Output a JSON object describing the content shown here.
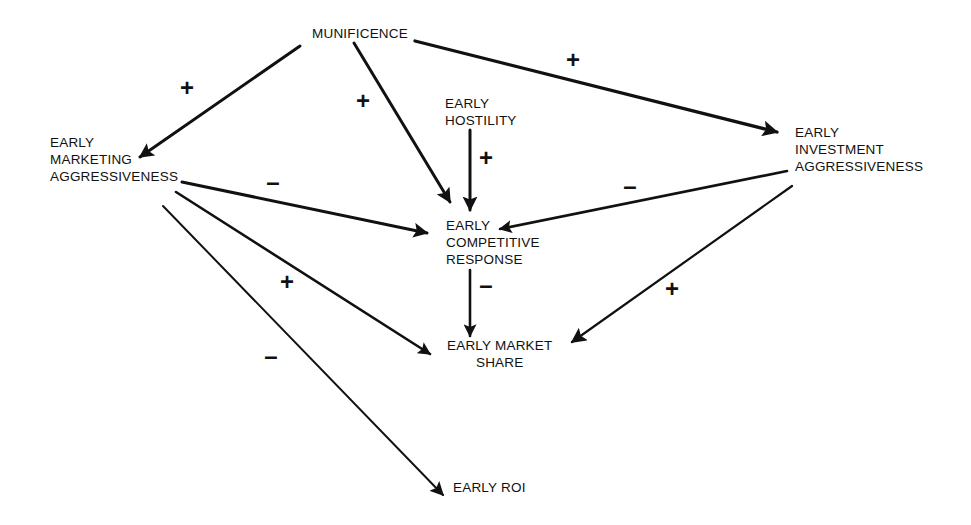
{
  "nodes": {
    "munificence": {
      "lines": [
        "MUNIFICENCE"
      ]
    },
    "early_marketing_aggressiveness": {
      "lines": [
        "EARLY",
        "MARKETING",
        "AGGRESSIVENESS"
      ]
    },
    "early_hostility": {
      "lines": [
        "EARLY",
        "HOSTILITY"
      ]
    },
    "early_investment_aggressiveness": {
      "lines": [
        "EARLY",
        "INVESTMENT",
        "AGGRESSIVENESS"
      ]
    },
    "early_competitive_response": {
      "lines": [
        "EARLY",
        "COMPETITIVE",
        "RESPONSE"
      ]
    },
    "early_market_share": {
      "lines": [
        "EARLY MARKET",
        "SHARE"
      ]
    },
    "early_roi": {
      "lines": [
        "EARLY ROI"
      ]
    }
  },
  "edges": [
    {
      "from": "MUNIFICENCE",
      "to": "EARLY MARKETING AGGRESSIVENESS",
      "sign": "+"
    },
    {
      "from": "MUNIFICENCE",
      "to": "EARLY COMPETITIVE RESPONSE",
      "sign": "+"
    },
    {
      "from": "MUNIFICENCE",
      "to": "EARLY INVESTMENT AGGRESSIVENESS",
      "sign": "+"
    },
    {
      "from": "EARLY HOSTILITY",
      "to": "EARLY COMPETITIVE RESPONSE",
      "sign": "+"
    },
    {
      "from": "EARLY MARKETING AGGRESSIVENESS",
      "to": "EARLY COMPETITIVE RESPONSE",
      "sign": "–"
    },
    {
      "from": "EARLY INVESTMENT AGGRESSIVENESS",
      "to": "EARLY COMPETITIVE RESPONSE",
      "sign": "–"
    },
    {
      "from": "EARLY MARKETING AGGRESSIVENESS",
      "to": "EARLY MARKET SHARE",
      "sign": "+"
    },
    {
      "from": "EARLY COMPETITIVE RESPONSE",
      "to": "EARLY MARKET SHARE",
      "sign": "–"
    },
    {
      "from": "EARLY INVESTMENT AGGRESSIVENESS",
      "to": "EARLY MARKET SHARE",
      "sign": "+"
    },
    {
      "from": "EARLY MARKETING AGGRESSIVENESS",
      "to": "EARLY ROI",
      "sign": "–"
    }
  ],
  "colors": {
    "line": "#111111",
    "background": "#ffffff"
  }
}
